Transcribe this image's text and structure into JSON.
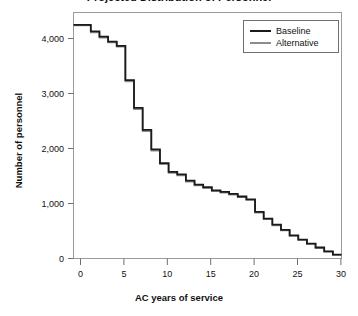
{
  "figure": {
    "title_partial": "Projected Distribution of Personnel",
    "background": "#ffffff"
  },
  "axes": {
    "x_title": "AC years of service",
    "y_title": "Number of personnel",
    "x_ticks": [
      "0",
      "5",
      "10",
      "15",
      "20",
      "25",
      "30"
    ],
    "y_ticks": [
      "0",
      "1,000",
      "2,000",
      "3,000",
      "4,000"
    ]
  },
  "legend": {
    "position": "top-right",
    "entries": [
      {
        "label": "Baseline",
        "color": "#1a1a1a"
      },
      {
        "label": "Alternative",
        "color": "#8c8c8c"
      }
    ]
  },
  "chart_data": {
    "type": "line",
    "title": "Projected Distribution of Personnel",
    "xlabel": "AC years of service",
    "ylabel": "Number of personnel",
    "xlim": [
      0,
      31
    ],
    "ylim": [
      0,
      4800
    ],
    "xticks": [
      0,
      5,
      10,
      15,
      20,
      25,
      30
    ],
    "yticks": [
      0,
      1000,
      2000,
      3000,
      4000
    ],
    "grid": false,
    "step_style": "post",
    "x": [
      0,
      1,
      2,
      3,
      4,
      5,
      6,
      7,
      8,
      9,
      10,
      11,
      12,
      13,
      14,
      15,
      16,
      17,
      18,
      19,
      20,
      21,
      22,
      23,
      24,
      25,
      26,
      27,
      28,
      29,
      30
    ],
    "series": [
      {
        "name": "Baseline",
        "color": "#1a1a1a",
        "values": [
          4560,
          4560,
          4430,
          4330,
          4230,
          4150,
          3480,
          2940,
          2510,
          2130,
          1860,
          1690,
          1640,
          1520,
          1440,
          1390,
          1330,
          1300,
          1260,
          1210,
          1155,
          910,
          780,
          660,
          560,
          450,
          370,
          290,
          215,
          140,
          75
        ]
      },
      {
        "name": "Alternative",
        "color": "#8c8c8c",
        "values": [
          4545,
          4545,
          4410,
          4310,
          4215,
          4135,
          3455,
          2915,
          2485,
          2105,
          1840,
          1670,
          1620,
          1500,
          1425,
          1375,
          1315,
          1285,
          1245,
          1195,
          1140,
          895,
          765,
          645,
          545,
          440,
          360,
          282,
          208,
          134,
          70
        ]
      }
    ]
  }
}
